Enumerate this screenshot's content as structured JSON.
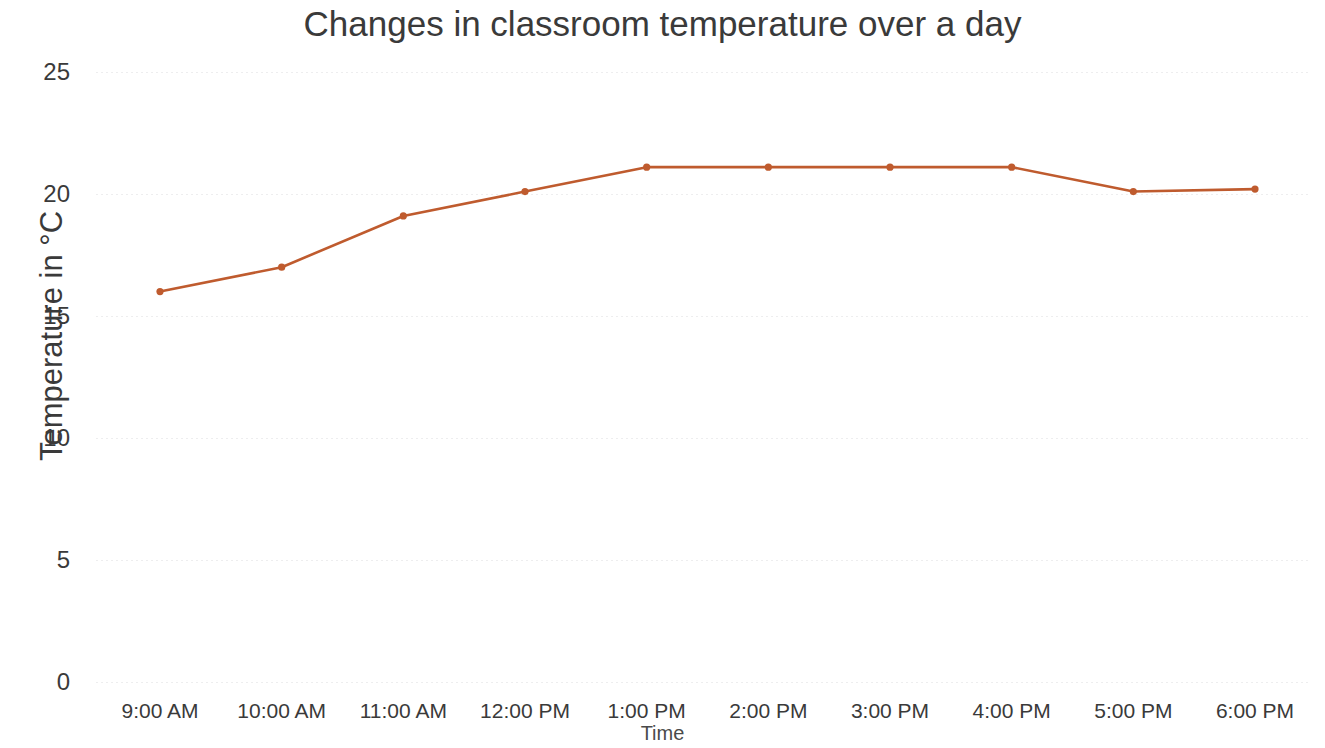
{
  "chart_data": {
    "type": "line",
    "title": "Changes in classroom temperature over a day",
    "xlabel": "Time",
    "ylabel": "Temperature in °C",
    "categories": [
      "9:00 AM",
      "10:00 AM",
      "11:00 AM",
      "12:00 PM",
      "1:00 PM",
      "2:00 PM",
      "3:00 PM",
      "4:00 PM",
      "5:00 PM",
      "6:00 PM"
    ],
    "values": [
      16,
      17,
      19.1,
      20.1,
      21.1,
      21.1,
      21.1,
      21.1,
      20.1,
      20.2
    ],
    "series": [
      {
        "name": "Temperature",
        "values": [
          16,
          17,
          19.1,
          20.1,
          21.1,
          21.1,
          21.1,
          21.1,
          20.1,
          20.2
        ]
      }
    ],
    "ylim": [
      0,
      25
    ],
    "yticks": [
      0,
      5,
      10,
      15,
      20,
      25
    ],
    "ytick_labels": [
      "0",
      "5",
      "10",
      "15",
      "20",
      "25"
    ],
    "grid": true,
    "grid_axis": "y",
    "legend": false,
    "legend_position": "none",
    "line_color": "#bf5b2e",
    "marker_color": "#bf5b2e",
    "marker": "circle",
    "background_color": "#ffffff",
    "text_color": "#3a3a3a"
  }
}
